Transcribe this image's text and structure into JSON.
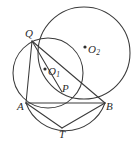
{
  "figure": {
    "kind": "plane-geometry-diagram",
    "background_color": "#ffffff",
    "stroke_color": "#3a3a3a",
    "label_color": "#2b2b2b",
    "canvas": {
      "width": 138,
      "height": 145
    },
    "points": [
      {
        "id": "Q",
        "label": "Q",
        "sub": "",
        "x": 32,
        "y": 41,
        "label_x": 25,
        "label_y": 28
      },
      {
        "id": "A",
        "label": "A",
        "sub": "",
        "x": 26,
        "y": 103,
        "label_x": 17,
        "label_y": 101
      },
      {
        "id": "B",
        "label": "B",
        "sub": "",
        "x": 105,
        "y": 103,
        "label_x": 106,
        "label_y": 101
      },
      {
        "id": "P",
        "label": "P",
        "sub": "",
        "x": 62,
        "y": 92,
        "label_x": 62,
        "label_y": 83
      },
      {
        "id": "T",
        "label": "T",
        "sub": "",
        "x": 62,
        "y": 128,
        "label_x": 59,
        "label_y": 129
      },
      {
        "id": "O1",
        "label": "O",
        "sub": "1",
        "x": 45,
        "y": 69,
        "label_x": 48,
        "label_y": 66
      },
      {
        "id": "O2",
        "label": "O",
        "sub": "2",
        "x": 85,
        "y": 47,
        "label_x": 88,
        "label_y": 44
      }
    ],
    "circles": [
      {
        "id": "circle-O1",
        "name": "small-circle",
        "cx": 48,
        "cy": 73,
        "r": 35
      },
      {
        "id": "circle-O2",
        "name": "large-circle",
        "cx": 84,
        "cy": 53,
        "r": 46
      },
      {
        "id": "circle-arc-AB",
        "name": "lower-arc-through-A-and-B",
        "cx": 65,
        "cy": 70,
        "r": 42
      }
    ],
    "segments": [
      {
        "id": "seg-QA",
        "name": "segment-Q-A",
        "from": "Q",
        "to": "A"
      },
      {
        "id": "seg-QB",
        "name": "segment-Q-P-B",
        "from": "Q",
        "to": "B"
      },
      {
        "id": "seg-AB",
        "name": "segment-A-B",
        "from": "A",
        "to": "B"
      },
      {
        "id": "seg-AT",
        "name": "segment-A-T",
        "from": "A",
        "to": "T"
      },
      {
        "id": "seg-BT",
        "name": "segment-B-T",
        "from": "B",
        "to": "T"
      }
    ],
    "center_dots": [
      {
        "id": "dot-O1",
        "name": "center-dot-O1",
        "x": 45,
        "y": 69,
        "r": 1.6
      },
      {
        "id": "dot-O2",
        "name": "center-dot-O2",
        "x": 85,
        "y": 47,
        "r": 1.6
      }
    ]
  }
}
